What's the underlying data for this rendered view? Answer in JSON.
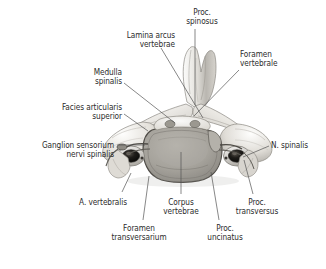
{
  "figure": {
    "background_color": "#ffffff",
    "text_color": "#2b2b2b",
    "leader_color": "#555555",
    "width": 326,
    "height": 269
  },
  "labels": [
    {
      "id": "lamina-arcus-vertebrae",
      "lines": [
        "Lamina arcus",
        "vertebrae"
      ],
      "align": "right",
      "x": 103,
      "y": 31,
      "w": 72
    },
    {
      "id": "proc-spinosus",
      "lines": [
        "Proc.",
        "spinosus"
      ],
      "align": "center",
      "x": 176,
      "y": 8,
      "w": 52
    },
    {
      "id": "foramen-vertebrale",
      "lines": [
        "Foramen",
        "vertebrale"
      ],
      "align": "left",
      "x": 240,
      "y": 50,
      "w": 62
    },
    {
      "id": "medulla-spinalis",
      "lines": [
        "Medulla",
        "spinalis"
      ],
      "align": "right",
      "x": 58,
      "y": 68,
      "w": 64
    },
    {
      "id": "facies-articularis-superior",
      "lines": [
        "Facies articularis",
        "superior"
      ],
      "align": "right",
      "x": 22,
      "y": 103,
      "w": 100
    },
    {
      "id": "ganglion-sensorium-nervi-spinalis",
      "lines": [
        "Ganglion sensorium",
        "nervi spinalis"
      ],
      "align": "right",
      "x": 7,
      "y": 141,
      "w": 107
    },
    {
      "id": "n-spinalis",
      "lines": [
        "N. spinalis"
      ],
      "align": "left",
      "x": 271,
      "y": 141,
      "w": 52
    },
    {
      "id": "a-vertebralis",
      "lines": [
        "A. vertebralis"
      ],
      "align": "right",
      "x": 57,
      "y": 198,
      "w": 70
    },
    {
      "id": "corpus-vertebrae",
      "lines": [
        "Corpus",
        "vertebrae"
      ],
      "align": "center",
      "x": 150,
      "y": 198,
      "w": 62
    },
    {
      "id": "proc-transversus",
      "lines": [
        "Proc.",
        "transversus"
      ],
      "align": "center",
      "x": 224,
      "y": 198,
      "w": 66
    },
    {
      "id": "foramen-transversarium",
      "lines": [
        "Foramen",
        "transversarium"
      ],
      "align": "center",
      "x": 98,
      "y": 224,
      "w": 82
    },
    {
      "id": "proc-uncinatus",
      "lines": [
        "Proc.",
        "uncinatus"
      ],
      "align": "center",
      "x": 195,
      "y": 224,
      "w": 60
    }
  ],
  "leaders": [
    {
      "id": "leader-lamina-arcus-vertebrae",
      "d": "M 161 48 L 203 118"
    },
    {
      "id": "leader-proc-spinosus",
      "d": "M 195 29 L 195 105"
    },
    {
      "id": "leader-foramen-vertebrale",
      "d": "M 239 70 L 194 116"
    },
    {
      "id": "leader-medulla-spinalis",
      "d": "M 124 83 L 175 123"
    },
    {
      "id": "leader-facies-articularis-superior",
      "d": "M 124 114 L 148 131"
    },
    {
      "id": "leader-ganglion-sensorium",
      "d": "M 117 145 L 145 145"
    },
    {
      "id": "leader-n-spinalis",
      "d": "M 269 146 L 243 157"
    },
    {
      "id": "leader-a-vertebralis",
      "d": "M 122 192 L 131 173"
    },
    {
      "id": "leader-corpus-vertebrae",
      "d": "M 181 194 L 181 152"
    },
    {
      "id": "leader-proc-transversus",
      "d": "M 253 194 L 244 160"
    },
    {
      "id": "leader-foramen-transversarium",
      "d": "M 143 220 L 149 176"
    },
    {
      "id": "leader-proc-uncinatus",
      "d": "M 219 220 L 211 172"
    }
  ]
}
